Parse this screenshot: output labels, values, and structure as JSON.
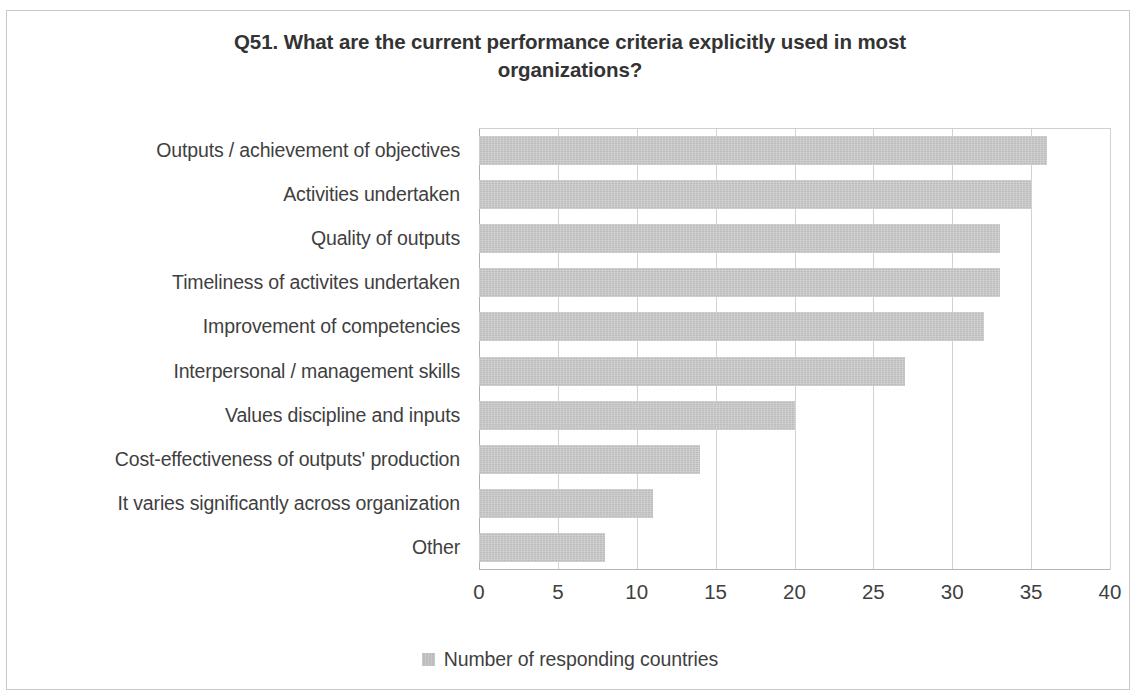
{
  "chart_data": {
    "type": "bar",
    "orientation": "horizontal",
    "title": "Q51. What are the current performance criteria explicitly used in most organizations?",
    "title_line1": "Q51. What are the current performance criteria explicitly used in most",
    "title_line2": "organizations?",
    "xlabel": "",
    "ylabel": "",
    "xlim": [
      0,
      40
    ],
    "xticks": [
      0,
      5,
      10,
      15,
      20,
      25,
      30,
      35,
      40
    ],
    "xtick_labels": [
      "0",
      "5",
      "10",
      "15",
      "20",
      "25",
      "30",
      "35",
      "40"
    ],
    "grid": "vertical",
    "legend_position": "bottom",
    "legend": [
      "Number of responding countries"
    ],
    "series": [
      {
        "name": "Number of responding countries",
        "color": "#bdbdbd",
        "values": [
          36,
          35,
          33,
          33,
          32,
          27,
          20,
          14,
          11,
          8
        ]
      }
    ],
    "categories": [
      "Outputs / achievement of objectives",
      "Activities undertaken",
      "Quality of outputs",
      "Timeliness of activites undertaken",
      "Improvement of competencies",
      "Interpersonal / management skills",
      "Values discipline and inputs",
      "Cost-effectiveness of outputs' production",
      "It varies significantly across organization",
      "Other"
    ]
  },
  "style": {
    "bar_color": "#bdbdbd",
    "gridline_color": "#d2d2d2",
    "axis_color": "#b0b0b0",
    "text_color": "#3f3f3f",
    "border_color": "#c9c9c9",
    "background": "#ffffff"
  }
}
